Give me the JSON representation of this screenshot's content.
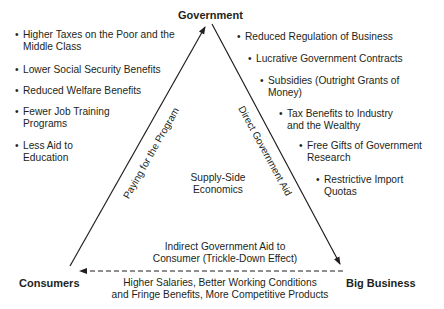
{
  "nodes": {
    "top": "Government",
    "left": "Consumers",
    "right": "Big Business"
  },
  "center_label": [
    "Supply-Side",
    "Economics"
  ],
  "edges": {
    "left_edge_label": "Paying for the Program",
    "right_edge_label": "Direct Government Aid",
    "bottom_edge_label_above": [
      "Indirect Government Aid to",
      "Consumer (Trickle-Down Effect)"
    ],
    "bottom_edge_label_below": [
      "Higher Salaries, Better Working Conditions",
      "and Fringe Benefits, More Competitive Products"
    ]
  },
  "left_list": {
    "items": [
      {
        "line1": "Higher Taxes on the Poor and the",
        "line2": "Middle Class"
      },
      {
        "line1": "Lower Social Security Benefits",
        "line2": ""
      },
      {
        "line1": "Reduced Welfare Benefits",
        "line2": ""
      },
      {
        "line1": "Fewer Job Training",
        "line2": "Programs"
      },
      {
        "line1": "Less Aid to",
        "line2": "Education"
      }
    ]
  },
  "right_list": {
    "items": [
      {
        "line1": "Reduced Regulation of Business",
        "line2": ""
      },
      {
        "line1": "Lucrative Government Contracts",
        "line2": ""
      },
      {
        "line1": "Subsidies (Outright Grants of",
        "line2": "Money)"
      },
      {
        "line1": "Tax Benefits to Industry",
        "line2": "and the Wealthy"
      },
      {
        "line1": "Free Gifts of Government",
        "line2": "Research"
      },
      {
        "line1": "Restrictive Import",
        "line2": "Quotas"
      }
    ]
  },
  "bullet": "•",
  "colors": {
    "ink": "#231f20",
    "background": "#ffffff"
  }
}
